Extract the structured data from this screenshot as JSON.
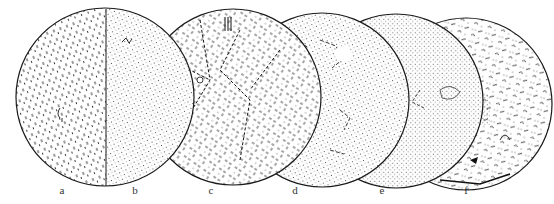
{
  "figure": {
    "type": "microstructure-sequence",
    "panels": [
      {
        "id": "a",
        "label": "a",
        "label_x": 62,
        "texture": "short-dashes"
      },
      {
        "id": "b",
        "label": "b",
        "label_x": 135,
        "texture": "fine-dots"
      },
      {
        "id": "c",
        "label": "c",
        "label_x": 211,
        "texture": "dashed-grain-boundaries"
      },
      {
        "id": "d",
        "label": "d",
        "label_x": 295,
        "texture": "dots-with-boundaries"
      },
      {
        "id": "e",
        "label": "e",
        "label_x": 382,
        "texture": "dots-with-dark-inclusions"
      },
      {
        "id": "f",
        "label": "f",
        "label_x": 466,
        "texture": "coarse-mixed-precipitates"
      }
    ],
    "circles": [
      {
        "cx": 105,
        "cy": 97,
        "r": 89,
        "split_x": 106
      },
      {
        "cx": 233,
        "cy": 97,
        "r": 88
      },
      {
        "cx": 322,
        "cy": 100,
        "r": 87
      },
      {
        "cx": 396,
        "cy": 101,
        "r": 87
      },
      {
        "cx": 466,
        "cy": 104,
        "r": 86
      }
    ],
    "colors": {
      "ink": "#1a1a1a",
      "paper": "#ffffff",
      "label": "#333333"
    }
  }
}
